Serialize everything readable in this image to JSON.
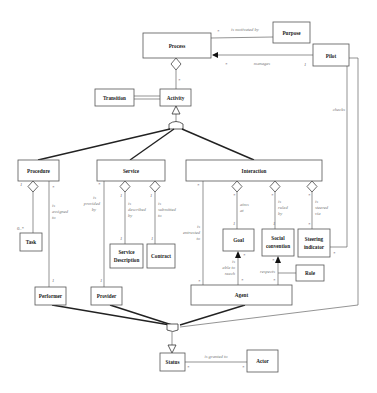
{
  "diagram": {
    "type": "UML class diagram",
    "classes": {
      "process": "Process",
      "purpose": "Purpose",
      "pilot": "Pilot",
      "transition": "Transition",
      "activity": "Activity",
      "procedure": "Procedure",
      "service": "Service",
      "interaction": "Interaction",
      "task": "Task",
      "service_description_1": "Service",
      "service_description_2": "Description",
      "contract": "Contract",
      "goal": "Goal",
      "social_convention_1": "Social",
      "social_convention_2": "convention",
      "steering_indicator_1": "Steering",
      "steering_indicator_2": "indicator",
      "role": "Role",
      "performer": "Performer",
      "provider": "Provider",
      "agent": "Agent",
      "status": "Status",
      "actor": "Actor"
    },
    "associations": {
      "is_motivated_by": "is motivated by",
      "manages": "manages",
      "checks": "checks",
      "is_assigned_to_1": "is",
      "is_assigned_to_2": "assigned",
      "is_assigned_to_3": "to",
      "is_provided_by_1": "is",
      "is_provided_by_2": "provided",
      "is_provided_by_3": "by",
      "is_described_by_1": "is",
      "is_described_by_2": "described",
      "is_described_by_3": "by",
      "is_submitted_to_1": "is",
      "is_submitted_to_2": "submitted",
      "is_submitted_to_3": "to",
      "is_entrusted_to_1": "is",
      "is_entrusted_to_2": "entrusted",
      "is_entrusted_to_3": "to",
      "aims_at_1": "aims",
      "aims_at_2": "at",
      "is_ruled_by_1": "is",
      "is_ruled_by_2": "ruled",
      "is_ruled_by_3": "by",
      "is_steered_via_1": "is",
      "is_steered_via_2": "steered",
      "is_steered_via_3": "via",
      "is_able_to_reach_1": "is",
      "is_able_to_reach_2": "able to",
      "is_able_to_reach_3": "reach",
      "respects": "respects",
      "is_granted_to": "is granted to"
    },
    "multiplicities": {
      "star": "*",
      "one": "1",
      "zero_star": "0..*"
    }
  }
}
